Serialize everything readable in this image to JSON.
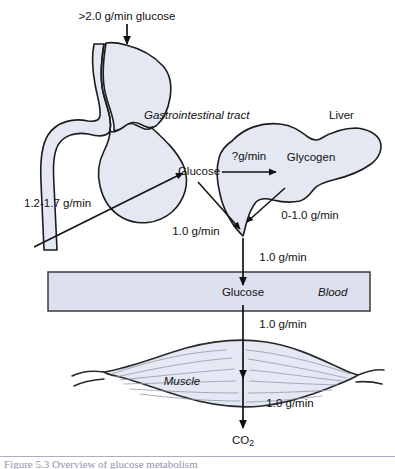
{
  "figure": {
    "background_color": "#ffffff",
    "organ_fill_color": "#e3e8f2",
    "blood_fill_color": "#dde1ef",
    "stroke_color": "#111111"
  },
  "labels": {
    "intake": ">2.0 g/min glucose",
    "gi_tract": "Gastrointestinal tract",
    "liver": "Liver",
    "glucose_liver": "Glucose",
    "glycogen": "Glycogen",
    "glucose_blood": "Glucose",
    "blood": "Blood",
    "muscle": "Muscle",
    "co2": "CO",
    "co2_subscript": "2"
  },
  "flux_rates": {
    "gut_absorption": "1.2-1.7 g/min",
    "glucose_to_glycogen": "?g/min",
    "glycogenolysis": "0-1.0 g/min",
    "hepatic_output": "1.0 g/min",
    "liver_to_blood": "1.0 g/min",
    "blood_to_muscle": "1.0 g/min",
    "muscle_to_co2": "1.0 g/min"
  },
  "caption": {
    "text": "Figure 5.3   Overview of glucose metabolism",
    "visible": "partially-cropped"
  }
}
